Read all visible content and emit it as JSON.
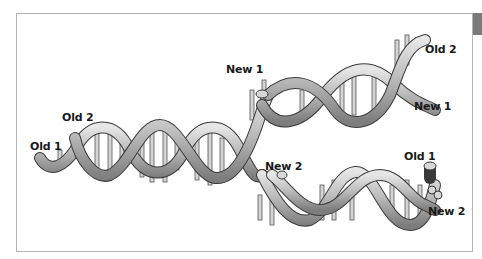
{
  "diagram": {
    "labels": {
      "old1_left": "Old 1",
      "old2_left": "Old 2",
      "new1_top": "New 1",
      "old2_right": "Old 2",
      "new1_right": "New 1",
      "new2_mid": "New 2",
      "old1_right": "Old 1",
      "new2_right": "New 2"
    },
    "bases": [
      "A",
      "T",
      "G",
      "C"
    ],
    "colors": {
      "strand_fill": "#c8c8c8",
      "strand_shade": "#8a8a8a",
      "strand_outline": "#3a3a3a",
      "frame": "#b5b5b5",
      "tab": "#7a7a7a"
    }
  }
}
